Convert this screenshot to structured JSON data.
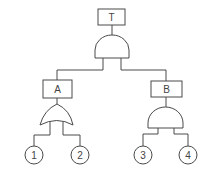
{
  "diagram": {
    "type": "fault-tree",
    "top_event": {
      "label": "T",
      "gate": "AND"
    },
    "intermediate_events": [
      {
        "id": "A",
        "label": "A",
        "gate": "OR",
        "inputs": [
          "1",
          "2"
        ]
      },
      {
        "id": "B",
        "label": "B",
        "gate": "AND",
        "inputs": [
          "3",
          "4"
        ]
      }
    ],
    "basic_events": [
      {
        "label": "1"
      },
      {
        "label": "2"
      },
      {
        "label": "3"
      },
      {
        "label": "4"
      }
    ],
    "colors": {
      "stroke": "#4a4a4a",
      "text": "#444444",
      "background": "#ffffff"
    }
  }
}
